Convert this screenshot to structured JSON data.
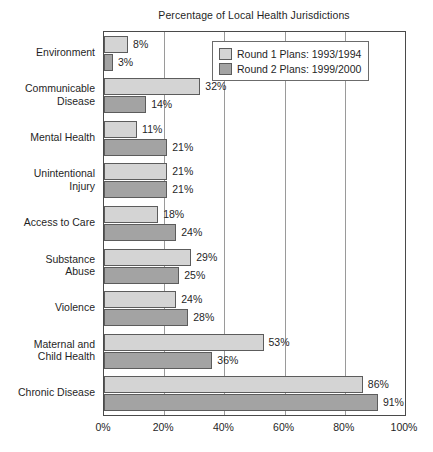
{
  "chart_data": {
    "type": "bar",
    "orientation": "horizontal",
    "title": "Percentage of Local Health Jurisdictions",
    "xlabel": "",
    "ylabel": "",
    "xlim": [
      0,
      100
    ],
    "xticks": [
      "0%",
      "20%",
      "40%",
      "60%",
      "80%",
      "100%"
    ],
    "xtick_values": [
      0,
      20,
      40,
      60,
      80,
      100
    ],
    "grid": "vertical",
    "legend_position": "top-right",
    "categories": [
      "Environment",
      "Communicable Disease",
      "Mental Health",
      "Unintentional Injury",
      "Access to Care",
      "Substance Abuse",
      "Violence",
      "Maternal and Child Health",
      "Chronic Disease"
    ],
    "category_lines": [
      [
        "Environment"
      ],
      [
        "Communicable",
        "Disease"
      ],
      [
        "Mental Health"
      ],
      [
        "Unintentional",
        "Injury"
      ],
      [
        "Access to Care"
      ],
      [
        "Substance",
        "Abuse"
      ],
      [
        "Violence"
      ],
      [
        "Maternal and",
        "Child Health"
      ],
      [
        "Chronic Disease"
      ]
    ],
    "series": [
      {
        "name": "Round 1 Plans: 1993/1994",
        "color": "#d4d4d4",
        "values": [
          8,
          32,
          11,
          21,
          18,
          29,
          24,
          53,
          86
        ],
        "labels": [
          "8%",
          "32%",
          "11%",
          "21%",
          "18%",
          "29%",
          "24%",
          "53%",
          "86%"
        ]
      },
      {
        "name": "Round 2 Plans: 1999/2000",
        "color": "#a3a3a3",
        "values": [
          3,
          14,
          21,
          21,
          24,
          25,
          28,
          36,
          91
        ],
        "labels": [
          "3%",
          "14%",
          "21%",
          "21%",
          "24%",
          "25%",
          "28%",
          "36%",
          "91%"
        ]
      }
    ]
  },
  "legend": {
    "items": [
      {
        "label": "Round 1 Plans: 1993/1994",
        "color": "#d4d4d4"
      },
      {
        "label": "Round 2 Plans: 1999/2000",
        "color": "#a3a3a3"
      }
    ]
  },
  "colors": {
    "round1": "#d4d4d4",
    "round2": "#a3a3a3",
    "axis": "#4a4a4a",
    "grid": "#9a9a9a",
    "text": "#1f1f1f",
    "background": "#ffffff"
  }
}
